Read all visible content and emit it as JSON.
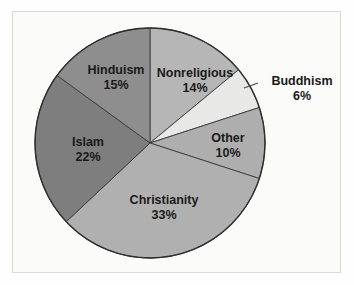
{
  "figure": {
    "background_color": "#fbfbfa",
    "frame_color": "#d9d9d6",
    "outline_color": "#2e2e2e"
  },
  "chart_data": {
    "type": "pie",
    "title": "",
    "subtitle": "",
    "xlabel": "",
    "ylabel": "",
    "legend_position": "none",
    "grid": false,
    "label_format": "name-above-percent",
    "start_angle_deg": 0,
    "direction": "clockwise",
    "categories": [
      "Nonreligious",
      "Buddhism",
      "Other",
      "Christianity",
      "Islam",
      "Hinduism"
    ],
    "values": [
      14,
      6,
      10,
      33,
      22,
      15
    ],
    "value_unit": "%",
    "slices": [
      {
        "name": "Nonreligious",
        "value": 14,
        "value_label": "14%",
        "color": "#b6b6b6",
        "label_placement": "inside",
        "label_x": 195,
        "label_y": 74,
        "pct_x": 195,
        "pct_y": 89
      },
      {
        "name": "Buddhism",
        "value": 6,
        "value_label": "6%",
        "color": "#e8e8e6",
        "label_placement": "outside",
        "label_x": 302,
        "label_y": 82,
        "pct_x": 302,
        "pct_y": 97,
        "leader_x1": 244,
        "leader_y1": 88,
        "leader_x2": 258,
        "leader_y2": 83
      },
      {
        "name": "Other",
        "value": 10,
        "value_label": "10%",
        "color": "#aeaeae",
        "label_placement": "inside",
        "label_x": 228,
        "label_y": 139,
        "pct_x": 228,
        "pct_y": 154
      },
      {
        "name": "Christianity",
        "value": 33,
        "value_label": "33%",
        "color": "#b0b0b0",
        "label_placement": "inside",
        "label_x": 164,
        "label_y": 201,
        "pct_x": 164,
        "pct_y": 216
      },
      {
        "name": "Islam",
        "value": 22,
        "value_label": "22%",
        "color": "#7e7e7e",
        "label_placement": "inside",
        "label_x": 88,
        "label_y": 143,
        "pct_x": 88,
        "pct_y": 158
      },
      {
        "name": "Hinduism",
        "value": 15,
        "value_label": "15%",
        "color": "#8e8e8e",
        "label_placement": "inside",
        "label_x": 116,
        "label_y": 71,
        "pct_x": 116,
        "pct_y": 86
      }
    ],
    "geometry": {
      "center_x": 150,
      "center_y": 143,
      "radius": 115
    }
  }
}
